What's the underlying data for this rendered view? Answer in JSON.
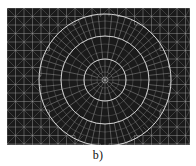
{
  "figure": {
    "caption": "b)",
    "panel": {
      "width": 183,
      "height": 137,
      "background_color": "#1a1a1a",
      "mesh_line_color": "#b9b9b9",
      "refinement_line_color": "#d8d8d8"
    }
  },
  "chart_data": {
    "type": "diagram",
    "title": "",
    "subtitle": "",
    "xlabel": "",
    "ylabel": "",
    "domain": {
      "shape": "rectangle",
      "x_range": [
        0,
        183
      ],
      "y_range": [
        0,
        137
      ]
    },
    "background_mesh": {
      "style": "structured-quad-with-diagonals",
      "cell_size_px": 8.5,
      "columns": 22,
      "rows": 17,
      "line_color": "#b9b9b9",
      "line_width": 0.45
    },
    "refinement": {
      "center": [
        98,
        72
      ],
      "rings": [
        {
          "index": 1,
          "radius": 21,
          "segments": 28,
          "label": "inner-ring"
        },
        {
          "index": 2,
          "radius": 44,
          "segments": 44,
          "label": "middle-ring"
        },
        {
          "index": 3,
          "radius": 66,
          "segments": 60,
          "label": "outer-ring"
        }
      ],
      "radial_spokes": 60,
      "intermediate_radii": [
        8,
        14,
        21,
        28,
        36,
        44,
        52,
        59,
        66
      ],
      "line_color": "#d8d8d8",
      "line_width": 0.55
    },
    "grid": false,
    "legend": null,
    "annotations": [
      {
        "text": "b)",
        "position": "bottom-center"
      }
    ]
  }
}
